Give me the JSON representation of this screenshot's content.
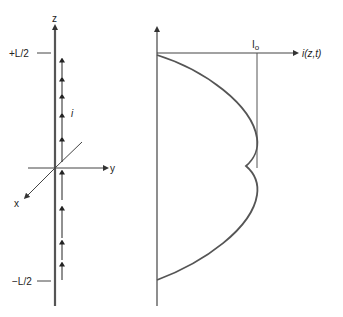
{
  "left_panel": {
    "z_axis_label": "z",
    "y_axis_label": "y",
    "x_axis_label": "x",
    "top_marker_label": "+L/2",
    "bottom_marker_label": "−L/2",
    "current_label": "i"
  },
  "right_panel": {
    "horizontal_axis_label": "i(z,t)",
    "peak_marker_label": "I",
    "peak_marker_subscript": "o"
  },
  "colors": {
    "axis": "#444444",
    "curve": "#555555",
    "text": "#222222"
  }
}
